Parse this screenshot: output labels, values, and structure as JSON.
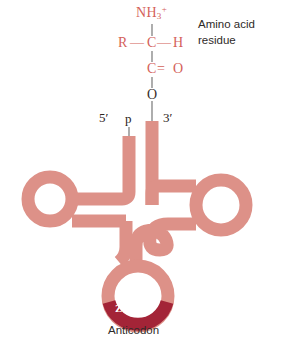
{
  "figure": {
    "background_color": "#ffffff"
  },
  "colors": {
    "backbone": "#dd9188",
    "backbone_edge": "#d4857c",
    "chem_red": "#d4615a",
    "chem_dark": "#3a2f2c",
    "anticodon_band": "#a32437",
    "anticodon_text": "#ffffff",
    "label_text": "#2e2a28",
    "bond_line": "#6b6b6b"
  },
  "amino_acid": {
    "amino_group": "NH",
    "amino_group_sub": "3",
    "amino_group_sup": "+",
    "r_group": "R",
    "alpha_carbon": "C",
    "hydrogen": "H",
    "bond_dash_left": "—",
    "bond_dash_right": "—",
    "carbonyl_carbon": "C",
    "double_bond": "=",
    "carbonyl_oxygen": "O",
    "ester_oxygen": "O",
    "label_line1": "Amino acid",
    "label_line2": "residue"
  },
  "trna": {
    "five_prime_label": "5′",
    "phosphate_label": "p",
    "three_prime_label": "3′",
    "anticodon_bases": "Z·Y·X",
    "anticodon_caption": "Anticodon"
  }
}
